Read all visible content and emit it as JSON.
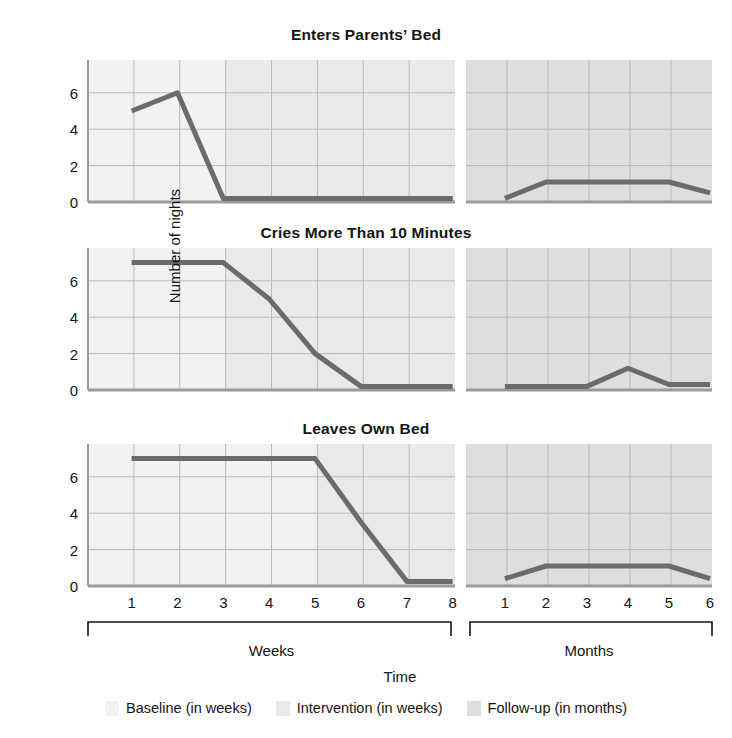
{
  "figure": {
    "y_axis_label": "Number of nights",
    "x_axis_label": "Time",
    "group_labels": {
      "weeks": "Weeks",
      "months": "Months"
    }
  },
  "legend": {
    "items": [
      {
        "label": "Baseline (in weeks)",
        "color": "#f2f2f2"
      },
      {
        "label": "Intervention (in weeks)",
        "color": "#e9e9e9"
      },
      {
        "label": "Follow-up (in months)",
        "color": "#dedede"
      }
    ]
  },
  "titles": {
    "panel1": "Enters Parents’ Bed",
    "panel2": "Cries More Than 10 Minutes",
    "panel3": "Leaves Own Bed"
  },
  "colors": {
    "line": "#6b6b6b",
    "grid": "#b9b9b9",
    "axis": "#9a9a9a",
    "baseline_band": "#f2f2f2",
    "intervention_band": "#e9e9e9",
    "followup_band": "#dedede",
    "text": "#141414"
  },
  "axes": {
    "y_ticks": [
      0,
      2,
      4,
      6
    ],
    "y_range": [
      0,
      7.8
    ],
    "x_week_ticks": [
      "1",
      "2",
      "3",
      "4",
      "5",
      "6",
      "7",
      "8"
    ],
    "x_month_ticks": [
      "1",
      "2",
      "3",
      "4",
      "5",
      "6"
    ]
  },
  "chart_data": [
    {
      "type": "line",
      "title": "Enters Parents’ Bed",
      "xlabel": "Time",
      "ylabel": "Number of nights",
      "ylim": [
        0,
        7.8
      ],
      "grid": true,
      "legend_position": "bottom",
      "phases": [
        {
          "name": "Baseline (in weeks)",
          "unit": "weeks",
          "from": 1,
          "to": 3
        },
        {
          "name": "Intervention (in weeks)",
          "unit": "weeks",
          "from": 3,
          "to": 8
        },
        {
          "name": "Follow-up (in months)",
          "unit": "months",
          "from": 1,
          "to": 6
        }
      ],
      "x": [
        "W1",
        "W2",
        "W3",
        "W4",
        "W5",
        "W6",
        "W7",
        "W8",
        "M1",
        "M2",
        "M3",
        "M4",
        "M5",
        "M6"
      ],
      "values": [
        5,
        6,
        0.2,
        0.2,
        0.2,
        0.2,
        0.2,
        0.2,
        0.2,
        1.1,
        1.1,
        1.1,
        1.1,
        0.5
      ]
    },
    {
      "type": "line",
      "title": "Cries More Than 10 Minutes",
      "xlabel": "Time",
      "ylabel": "Number of nights",
      "ylim": [
        0,
        7.8
      ],
      "grid": true,
      "legend_position": "bottom",
      "phases": [
        {
          "name": "Baseline (in weeks)",
          "unit": "weeks",
          "from": 1,
          "to": 3
        },
        {
          "name": "Intervention (in weeks)",
          "unit": "weeks",
          "from": 3,
          "to": 8
        },
        {
          "name": "Follow-up (in months)",
          "unit": "months",
          "from": 1,
          "to": 6
        }
      ],
      "x": [
        "W1",
        "W2",
        "W3",
        "W4",
        "W5",
        "W6",
        "W7",
        "W8",
        "M1",
        "M2",
        "M3",
        "M4",
        "M5",
        "M6"
      ],
      "values": [
        7,
        7,
        7,
        5,
        2,
        0.2,
        0.2,
        0.2,
        0.2,
        0.2,
        0.2,
        1.2,
        0.3,
        0.3
      ]
    },
    {
      "type": "line",
      "title": "Leaves Own Bed",
      "xlabel": "Time",
      "ylabel": "Number of nights",
      "ylim": [
        0,
        7.8
      ],
      "grid": true,
      "legend_position": "bottom",
      "phases": [
        {
          "name": "Baseline (in weeks)",
          "unit": "weeks",
          "from": 1,
          "to": 5
        },
        {
          "name": "Intervention (in weeks)",
          "unit": "weeks",
          "from": 5,
          "to": 8
        },
        {
          "name": "Follow-up (in months)",
          "unit": "months",
          "from": 1,
          "to": 6
        }
      ],
      "x": [
        "W1",
        "W2",
        "W3",
        "W4",
        "W5",
        "W6",
        "W7",
        "W8",
        "M1",
        "M2",
        "M3",
        "M4",
        "M5",
        "M6"
      ],
      "values": [
        7,
        7,
        7,
        7,
        7,
        3.5,
        0.25,
        0.25,
        0.4,
        1.1,
        1.1,
        1.1,
        1.1,
        0.4
      ]
    }
  ]
}
